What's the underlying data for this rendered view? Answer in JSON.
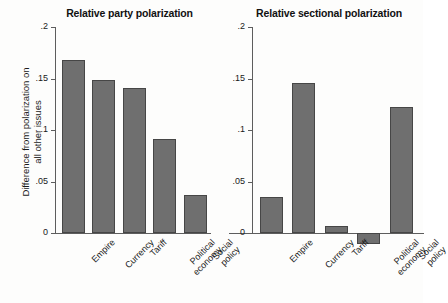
{
  "figure": {
    "y_axis_title_line1": "Difference from polarization on",
    "y_axis_title_line2": "all other issues",
    "bar_color": "#6f6f6f",
    "bar_edge_color": "#464646",
    "axis_color": "#5d5d5d",
    "background": "#fdfdfc"
  },
  "chart_data": [
    {
      "type": "bar",
      "title": "Relative party polarization",
      "xlabel": "",
      "ylabel": "Difference from polarization on all other issues",
      "categories": [
        "Empire",
        "Currency",
        "Tariff",
        "Political economy",
        "Social policy"
      ],
      "values": [
        0.168,
        0.149,
        0.141,
        0.091,
        0.037
      ],
      "ylim": [
        0,
        0.2
      ],
      "yticks": [
        0,
        0.05,
        0.1,
        0.15,
        0.2
      ],
      "ytick_labels": [
        "0",
        ".05",
        ".1",
        ".15",
        ".2"
      ],
      "grid": false,
      "legend": "none"
    },
    {
      "type": "bar",
      "title": "Relative sectional polarization",
      "xlabel": "",
      "ylabel": "",
      "categories": [
        "Empire",
        "Currency",
        "Tariff",
        "Political economy",
        "Social policy"
      ],
      "values": [
        0.035,
        0.146,
        0.007,
        -0.011,
        0.122
      ],
      "ylim": [
        0,
        0.2
      ],
      "yticks": [
        0,
        0.05,
        0.1,
        0.15,
        0.2
      ],
      "ytick_labels": [
        "0",
        ".05",
        ".1",
        ".15",
        ".2"
      ],
      "grid": false,
      "legend": "none"
    }
  ]
}
